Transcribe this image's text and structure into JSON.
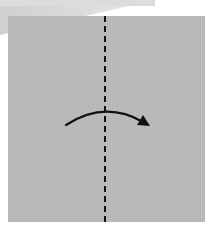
{
  "diagram": {
    "title": "",
    "fold_line": {
      "style": "valley-dashed",
      "orientation": "vertical",
      "position": "center"
    },
    "arrow": {
      "direction": "left-to-right",
      "shape": "curved"
    },
    "colors": {
      "paper": "#bdbdbd",
      "paper_back": "#d6d6d6",
      "line": "#111111",
      "background": "#ffffff"
    }
  }
}
